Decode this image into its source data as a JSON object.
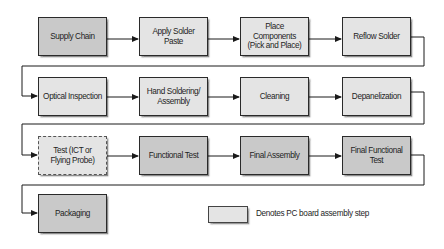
{
  "diagram": {
    "steps": [
      {
        "id": "supply-chain",
        "label": "Supply Chain",
        "style": "dark"
      },
      {
        "id": "apply-solder-paste",
        "label": "Apply Solder\nPaste",
        "style": "light"
      },
      {
        "id": "place-components",
        "label": "Place\nComponents\n(Pick and Place)",
        "style": "light"
      },
      {
        "id": "reflow-solder",
        "label": "Reflow Solder",
        "style": "light"
      },
      {
        "id": "optical-inspection",
        "label": "Optical Inspection",
        "style": "light"
      },
      {
        "id": "hand-soldering",
        "label": "Hand Soldering/\nAssembly",
        "style": "light"
      },
      {
        "id": "cleaning",
        "label": "Cleaning",
        "style": "light"
      },
      {
        "id": "depanelization",
        "label": "Depanelization",
        "style": "light"
      },
      {
        "id": "test-ict",
        "label": "Test (ICT or\nFlying Probe)",
        "style": "light-dashed"
      },
      {
        "id": "functional-test",
        "label": "Functional Test",
        "style": "dark"
      },
      {
        "id": "final-assembly",
        "label": "Final Assembly",
        "style": "dark"
      },
      {
        "id": "final-functional-test",
        "label": "Final Functional\nTest",
        "style": "dark"
      },
      {
        "id": "packaging",
        "label": "Packaging",
        "style": "dark"
      }
    ],
    "legend": {
      "label": "Denotes PC board assembly step",
      "swatch_color": "#e4e4e4"
    },
    "colors": {
      "light_fill": "#e4e4e4",
      "dark_fill": "#c9c9c9",
      "border": "#2a2a2a",
      "connector": "#1a1a1a"
    }
  }
}
